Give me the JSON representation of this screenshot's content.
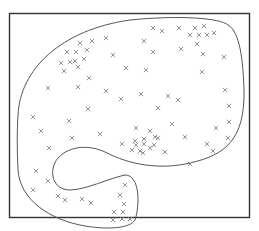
{
  "figure": {
    "frame": {
      "x": 9,
      "y": 13,
      "w": 241,
      "h": 205,
      "stroke": "#333333"
    },
    "boundary_stroke": "#555555",
    "marker_color": "#888888",
    "marker": "x"
  },
  "points": [
    [
      80,
      43
    ],
    [
      92,
      41
    ],
    [
      106,
      38
    ],
    [
      67,
      52
    ],
    [
      76,
      52
    ],
    [
      87,
      50
    ],
    [
      61,
      63
    ],
    [
      70,
      62
    ],
    [
      75,
      61
    ],
    [
      84,
      59
    ],
    [
      64,
      71
    ],
    [
      78,
      67
    ],
    [
      89,
      78
    ],
    [
      113,
      55
    ],
    [
      126,
      68
    ],
    [
      48,
      88
    ],
    [
      78,
      87
    ],
    [
      106,
      91
    ],
    [
      121,
      99
    ],
    [
      88,
      109
    ],
    [
      153,
      28
    ],
    [
      162,
      31
    ],
    [
      179,
      28
    ],
    [
      195,
      28
    ],
    [
      204,
      26
    ],
    [
      190,
      35
    ],
    [
      199,
      35
    ],
    [
      207,
      35
    ],
    [
      214,
      33
    ],
    [
      144,
      41
    ],
    [
      153,
      52
    ],
    [
      181,
      49
    ],
    [
      197,
      44
    ],
    [
      203,
      54
    ],
    [
      224,
      57
    ],
    [
      146,
      70
    ],
    [
      202,
      72
    ],
    [
      168,
      96
    ],
    [
      141,
      94
    ],
    [
      178,
      100
    ],
    [
      225,
      90
    ],
    [
      158,
      108
    ],
    [
      229,
      106
    ],
    [
      33,
      117
    ],
    [
      69,
      121
    ],
    [
      41,
      131
    ],
    [
      72,
      138
    ],
    [
      100,
      134
    ],
    [
      49,
      148
    ],
    [
      122,
      144
    ],
    [
      158,
      138
    ],
    [
      172,
      124
    ],
    [
      136,
      128
    ],
    [
      150,
      131
    ],
    [
      185,
      137
    ],
    [
      216,
      128
    ],
    [
      207,
      144
    ],
    [
      228,
      138
    ],
    [
      213,
      151
    ],
    [
      229,
      122
    ],
    [
      135,
      141
    ],
    [
      144,
      139
    ],
    [
      155,
      137
    ],
    [
      136,
      145
    ],
    [
      144,
      144
    ],
    [
      154,
      145
    ],
    [
      132,
      150
    ],
    [
      140,
      151
    ],
    [
      150,
      148
    ],
    [
      143,
      153
    ],
    [
      165,
      152
    ],
    [
      190,
      164
    ],
    [
      36,
      171
    ],
    [
      48,
      181
    ],
    [
      33,
      190
    ],
    [
      58,
      196
    ],
    [
      65,
      200
    ],
    [
      82,
      199
    ],
    [
      91,
      203
    ],
    [
      120,
      195
    ],
    [
      124,
      204
    ],
    [
      123,
      212
    ],
    [
      114,
      212
    ],
    [
      122,
      219
    ],
    [
      113,
      220
    ],
    [
      130,
      219
    ],
    [
      125,
      185
    ]
  ]
}
